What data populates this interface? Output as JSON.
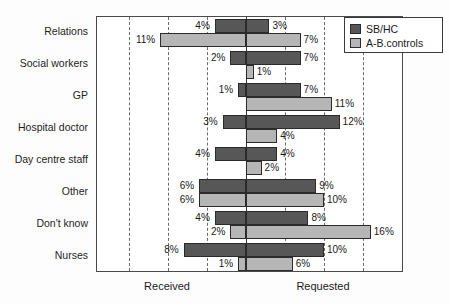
{
  "chart_data": {
    "type": "bar",
    "orientation": "horizontal-diverging",
    "title": "",
    "xlabel": "",
    "ylabel": "",
    "grid": true,
    "legend_position": "top-right",
    "axis_captions": {
      "left": "Received",
      "right": "Requested"
    },
    "xlim": [
      -20,
      20
    ],
    "x_unit": "%",
    "gridline_values": [
      -15,
      -10,
      -5,
      5,
      10,
      15
    ],
    "zero_line": 0,
    "categories": [
      "Relations",
      "Social workers",
      "GP",
      "Hospital doctor",
      "Day centre staff",
      "Other",
      "Don't know",
      "Nurses"
    ],
    "series": [
      {
        "name": "SB/HC",
        "color": "#575757",
        "received": [
          4,
          2,
          1,
          3,
          4,
          6,
          4,
          8
        ],
        "requested": [
          3,
          7,
          7,
          12,
          4,
          9,
          8,
          10
        ],
        "received_labels": [
          "4%",
          "2%",
          "1%",
          "3%",
          "4%",
          "6%",
          "4%",
          "8%"
        ],
        "requested_labels": [
          "3%",
          "7%",
          "7%",
          "12%",
          "4%",
          "9%",
          "8%",
          "10%"
        ]
      },
      {
        "name": "A-B.controls",
        "color": "#b6b6b6",
        "received": [
          11,
          0,
          0,
          0,
          0,
          6,
          2,
          1
        ],
        "requested": [
          7,
          1,
          11,
          4,
          2,
          10,
          16,
          6
        ],
        "received_labels": [
          "11%",
          "",
          "",
          "",
          "",
          "6%",
          "2%",
          "1%"
        ],
        "requested_labels": [
          "7%",
          "1%",
          "11%",
          "4%",
          "2%",
          "10%",
          "16%",
          "6%"
        ]
      }
    ]
  },
  "legend": {
    "items": [
      {
        "label": "SB/HC",
        "swatch": "sb"
      },
      {
        "label": "A-B.controls",
        "swatch": "ab"
      }
    ]
  }
}
